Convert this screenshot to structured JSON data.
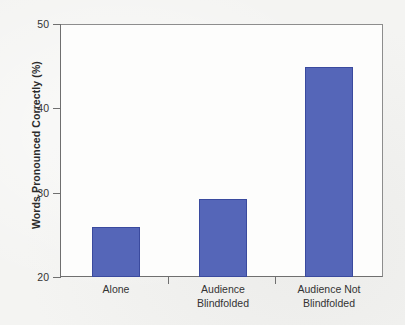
{
  "chart_data": {
    "type": "bar",
    "title": "",
    "subtitle": "",
    "xlabel": "",
    "ylabel": "Words Pronounced Correctly (%)",
    "categories": [
      "Alone",
      "Audience Blindfolded",
      "Audience Not Blindfolded"
    ],
    "category_lines": [
      [
        "Alone"
      ],
      [
        "Audience",
        "Blindfolded"
      ],
      [
        "Audience Not",
        "Blindfolded"
      ]
    ],
    "values": [
      25.9,
      29.3,
      44.9
    ],
    "ylim": [
      20,
      50
    ],
    "yticks": [
      20,
      30,
      40,
      50
    ],
    "ytick_labels": [
      "20",
      "30",
      "40",
      "50"
    ],
    "grid": false,
    "legend": "none",
    "bar_color": "#5566b8",
    "bar_border_color": "#3a4a9e",
    "axis_color": "#6f6f6f",
    "background_color": "#f4f4f2",
    "plot_background_color": "#fdfdfc"
  }
}
